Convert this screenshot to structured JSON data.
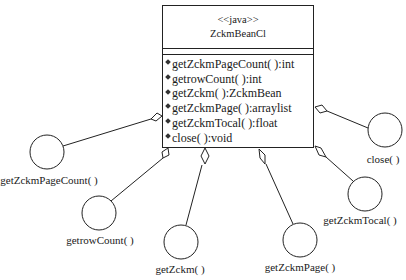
{
  "class": {
    "stereotype": "<<java>>",
    "name": "ZckmBeanCl",
    "methods": [
      "getZckmPageCount( ):int",
      "getrowCount( ):int",
      "getZckm( ):ZckmBean",
      "getZckmPage( ):arraylist",
      "getZckmTocal( ):float",
      "close( ):void"
    ]
  },
  "interfaces": [
    {
      "label": "getZckmPageCount( )"
    },
    {
      "label": "getrowCount( )"
    },
    {
      "label": "getZckm( )"
    },
    {
      "label": "getZckmPage( )"
    },
    {
      "label": "getZckmTocal( )"
    },
    {
      "label": "close( )"
    }
  ]
}
